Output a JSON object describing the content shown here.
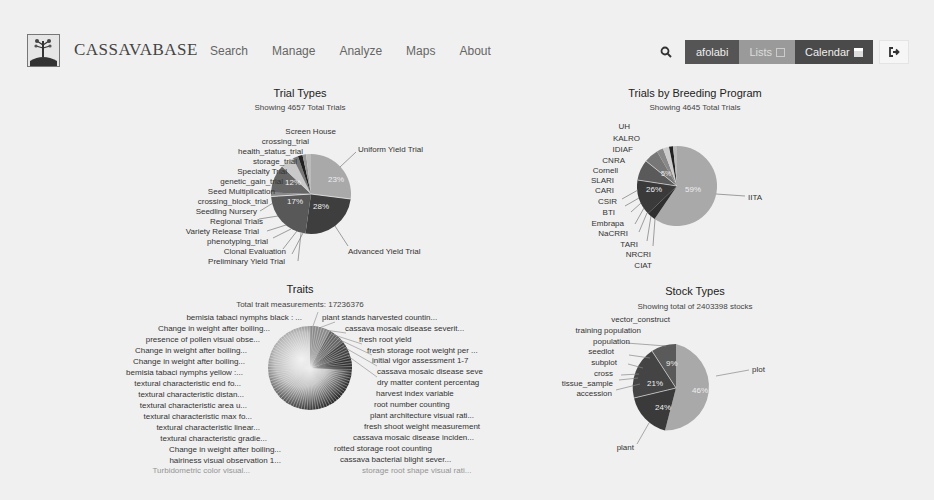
{
  "header": {
    "brand": "CASSAVABASE",
    "nav": [
      "Search",
      "Manage",
      "Analyze",
      "Maps",
      "About"
    ],
    "user": "afolabi",
    "lists_label": "Lists",
    "calendar_label": "Calendar",
    "icons": {
      "logo": "cassava-plant-logo",
      "search": "search-icon",
      "lists": "list-icon",
      "calendar": "calendar-icon",
      "logout": "logout-icon"
    }
  },
  "chart_data": [
    {
      "id": "trial-types",
      "type": "pie",
      "title": "Trial Types",
      "subtitle": "Showing 4657 Total Trials",
      "labels": [
        "Uniform Yield Trial",
        "Advanced Yield Trial",
        "Preliminary Yield Trial",
        "Clonal Evaluation",
        "phenotyping_trial",
        "Variety Release Trial",
        "Regional Trials",
        "Seedling Nursery",
        "crossing_block_trial",
        "Seed Multiplication",
        "genetic_gain_trial",
        "Specialty Trial",
        "storage_trial",
        "health_status_trial",
        "crossing_trial",
        "Screen House"
      ],
      "values": [
        23,
        28,
        17,
        0.4,
        0.4,
        0.4,
        0.4,
        0.4,
        0.6,
        12,
        6,
        0.8,
        2,
        0.8,
        1.5,
        0.8
      ],
      "percent_labels": [
        "23%",
        "28%",
        "17%",
        "",
        "",
        "",
        "",
        "",
        "",
        "12%",
        "",
        "",
        "",
        "",
        "",
        ""
      ],
      "legend": "none (callout labels)"
    },
    {
      "id": "breeding-programs",
      "type": "pie",
      "title": "Trials by Breeding Program",
      "subtitle": "Showing 4645 Total Trials",
      "labels": [
        "IITA",
        "CIAT",
        "NRCRI",
        "TARI",
        "NaCRRI",
        "Embrapa",
        "BTI",
        "CSIR",
        "CARI",
        "SLARI",
        "Cornell",
        "CNRA",
        "IDIAF",
        "KALRO",
        "UH"
      ],
      "values": [
        59,
        0.5,
        0.5,
        0.4,
        0.4,
        0.5,
        0.4,
        0.4,
        26,
        0.4,
        5,
        3,
        0.6,
        2,
        0.6
      ],
      "percent_labels": [
        "59%",
        "",
        "",
        "",
        "",
        "",
        "",
        "",
        "26%",
        "",
        "5%",
        "",
        "",
        "",
        ""
      ],
      "legend": "none (callout labels)"
    },
    {
      "id": "traits",
      "type": "pie",
      "title": "Traits",
      "subtitle": "Total trait measurements: 17236376",
      "labels": [
        "plant stands harvested countin...",
        "cassava mosaic disease severit...",
        "fresh root yield",
        "fresh storage root weight per ...",
        "initial vigor assessment 1-7",
        "cassava mosaic disease seve",
        "dry matter content percentag",
        "harvest index variable",
        "root number counting",
        "plant architecture visual rati...",
        "fresh shoot weight measurement",
        "cassava mosaic disease inciden...",
        "rotted storage root counting",
        "cassava bacterial blight sever...",
        "storage root shape visual rati...",
        "Turbidometric color visual...",
        "hairiness visual observation 1...",
        "Change in weight after boiling...",
        "textural characteristic gradie...",
        "textural characteristic linear...",
        "textural characteristic max fo...",
        "textural characteristic area u...",
        "textural characteristic distan...",
        "textural characteristic end fo...",
        "bemisia tabaci nymphs yellow :...",
        "Change in weight after boiling...",
        "Change in weight after boiling...",
        "presence of pollen visual obse...",
        "Change in weight after boiling...",
        "bemisia tabaci nymphs black : ..."
      ],
      "values": [
        3,
        3,
        2.5,
        2.5,
        2.5,
        2,
        2,
        2,
        2,
        2,
        1.5,
        1.5,
        1.5,
        1.5,
        1.2,
        1,
        1,
        1,
        1,
        1,
        1,
        1,
        1,
        1,
        1,
        1,
        1,
        1,
        1,
        1
      ],
      "note": "Many small slices (~100) rendered as a dense radial fan; only labels visible listed",
      "legend": "none (callout labels)"
    },
    {
      "id": "stock-types",
      "type": "pie",
      "title": "Stock Types",
      "subtitle": "Showing total of 2403398 stocks",
      "labels": [
        "plot",
        "plant",
        "accession",
        "tissue_sample",
        "cross",
        "subplot",
        "seedlot",
        "population",
        "training population",
        "vector_construct"
      ],
      "values": [
        46,
        24,
        21,
        0.3,
        0.3,
        9,
        0.2,
        0.1,
        0.05,
        0.05
      ],
      "percent_labels": [
        "46%",
        "24%",
        "21%",
        "",
        "",
        "9%",
        "",
        "",
        "",
        ""
      ],
      "legend": "none (callout labels)"
    }
  ]
}
